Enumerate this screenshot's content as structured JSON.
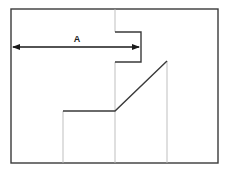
{
  "diagram": {
    "type": "technical-dimension-diagram",
    "colors": {
      "frame": "#3a3a3a",
      "dark_line": "#3a3a3a",
      "light_line": "#b8b8b8",
      "arrow": "#1a1a1a",
      "background": "#ffffff"
    },
    "frame": {
      "x1": 11,
      "y1": 9,
      "x2": 218,
      "y2": 163
    },
    "dimension": {
      "label": "A",
      "label_position": {
        "x": 77,
        "y": 41
      },
      "arrow": {
        "x1": 13,
        "x2": 139,
        "y": 47
      }
    },
    "bracket": {
      "left_x": 115,
      "right_x": 141,
      "top_y": 32,
      "bottom_y": 62
    },
    "profile": {
      "horizontal": {
        "x1": 63,
        "x2": 115,
        "y": 111
      },
      "diagonal": {
        "x1": 115,
        "y1": 111,
        "x2": 167,
        "y2": 61
      }
    },
    "guide_lines": [
      {
        "name": "left-guide",
        "x": 63,
        "y1": 111,
        "y2": 163
      },
      {
        "name": "center-guide-top",
        "x": 115,
        "y1": 9,
        "y2": 32
      },
      {
        "name": "center-guide-bottom",
        "x": 115,
        "y1": 62,
        "y2": 163
      },
      {
        "name": "right-guide",
        "x": 167,
        "y1": 61,
        "y2": 163
      }
    ]
  }
}
